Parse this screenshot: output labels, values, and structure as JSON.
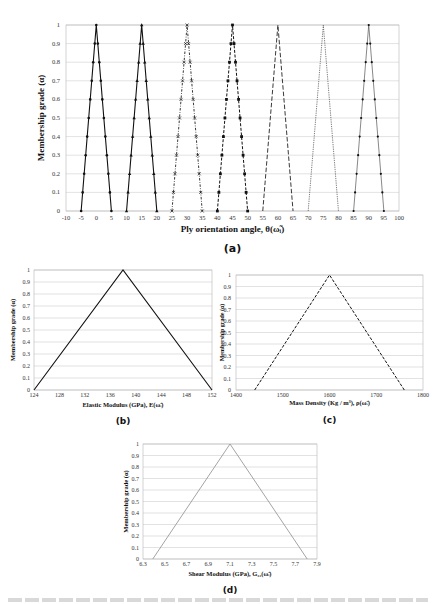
{
  "figure": {
    "panels": [
      "(a)",
      "(b)",
      "(c)",
      "(d)"
    ],
    "caption_visible_text": ""
  },
  "chart_data": [
    {
      "id": "a",
      "type": "line",
      "panel_label": "(a)",
      "title": "",
      "xlabel": "Ply orientation angle, θ(ω̃ᵢ)",
      "ylabel": "Membership grade (α)",
      "xlim": [
        -10,
        100
      ],
      "ylim": [
        0,
        1
      ],
      "xticks": [
        -10,
        -5,
        0,
        5,
        10,
        15,
        20,
        25,
        30,
        35,
        40,
        45,
        50,
        55,
        60,
        65,
        70,
        75,
        80,
        85,
        90,
        95,
        100
      ],
      "yticks": [
        0,
        0.1,
        0.2,
        0.3,
        0.4,
        0.5,
        0.6,
        0.7,
        0.8,
        0.9,
        1
      ],
      "grid": "horizontal",
      "legend": "none",
      "series": [
        {
          "name": "0°",
          "x": [
            -5,
            0,
            5
          ],
          "y": [
            0,
            1,
            0
          ],
          "style": "solid",
          "marker": "dot"
        },
        {
          "name": "15°",
          "x": [
            10,
            15,
            20
          ],
          "y": [
            0,
            1,
            0
          ],
          "style": "solid",
          "marker": "triangle"
        },
        {
          "name": "30°",
          "x": [
            25,
            30,
            35
          ],
          "y": [
            0,
            1,
            0
          ],
          "style": "dash-dot",
          "marker": "x"
        },
        {
          "name": "45°",
          "x": [
            40,
            45,
            50
          ],
          "y": [
            0,
            1,
            0
          ],
          "style": "dash",
          "marker": "square"
        },
        {
          "name": "60°",
          "x": [
            55,
            60,
            65
          ],
          "y": [
            0,
            1,
            0
          ],
          "style": "long-dash",
          "marker": "none"
        },
        {
          "name": "75°",
          "x": [
            70,
            75,
            80
          ],
          "y": [
            0,
            1,
            0
          ],
          "style": "dotted",
          "marker": "none"
        },
        {
          "name": "90°",
          "x": [
            85,
            90,
            95
          ],
          "y": [
            0,
            1,
            0
          ],
          "style": "thin",
          "marker": "small-dot"
        }
      ]
    },
    {
      "id": "b",
      "type": "line",
      "panel_label": "(b)",
      "title": "",
      "xlabel": "Elastic Modulus (GPa), E(ω̃ᵢ)",
      "ylabel": "Membership grade (α)",
      "xlim": [
        124,
        152
      ],
      "ylim": [
        0,
        1
      ],
      "xticks": [
        124,
        128,
        132,
        136,
        140,
        144,
        148,
        152
      ],
      "yticks": [
        0,
        0.1,
        0.2,
        0.3,
        0.4,
        0.5,
        0.6,
        0.7,
        0.8,
        0.9,
        1
      ],
      "grid": "horizontal",
      "series": [
        {
          "name": "E",
          "x": [
            124,
            138,
            152
          ],
          "y": [
            0,
            1,
            0
          ],
          "style": "solid"
        }
      ]
    },
    {
      "id": "c",
      "type": "line",
      "panel_label": "(c)",
      "title": "",
      "xlabel": "Mass Density (Kg / m³), ρ(ω̃ᵢ)",
      "ylabel": "Membership grade (α)",
      "xlim": [
        1400,
        1800
      ],
      "ylim": [
        0,
        1
      ],
      "xticks": [
        1400,
        1500,
        1600,
        1700,
        1800
      ],
      "yticks": [
        0,
        0.1,
        0.2,
        0.3,
        0.4,
        0.5,
        0.6,
        0.7,
        0.8,
        0.9,
        1
      ],
      "grid": "horizontal",
      "series": [
        {
          "name": "rho",
          "x": [
            1440,
            1600,
            1760
          ],
          "y": [
            0,
            1,
            0
          ],
          "style": "dash"
        }
      ]
    },
    {
      "id": "d",
      "type": "line",
      "panel_label": "(d)",
      "title": "",
      "xlabel": "Shear Modulus (GPa), G₁₂(ω̃ᵢ)",
      "ylabel": "Membership grade (α)",
      "xlim": [
        6.3,
        7.9
      ],
      "ylim": [
        0,
        1
      ],
      "xticks": [
        6.3,
        6.5,
        6.7,
        6.9,
        7.1,
        7.3,
        7.5,
        7.7,
        7.9
      ],
      "yticks": [
        0,
        0.1,
        0.2,
        0.3,
        0.4,
        0.5,
        0.6,
        0.7,
        0.8,
        0.9,
        1
      ],
      "grid": "horizontal",
      "series": [
        {
          "name": "G12",
          "x": [
            6.39,
            7.1,
            7.81
          ],
          "y": [
            0,
            1,
            0
          ],
          "style": "solid-light"
        }
      ]
    }
  ]
}
